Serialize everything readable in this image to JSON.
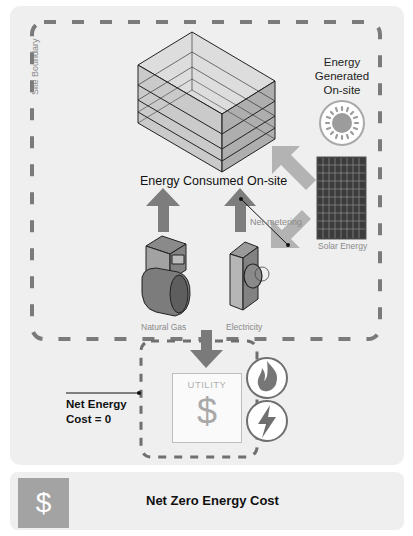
{
  "diagram": {
    "title": "Net Zero Energy Cost",
    "site_boundary_label": "Site Boundary",
    "energy_generated_label": [
      "Energy",
      "Generated",
      "On-site"
    ],
    "energy_consumed_label": "Energy Consumed On-site",
    "net_metering_label": "Net-metering",
    "solar_label": "Solar Energy",
    "natural_gas_label": "Natural Gas",
    "electricity_label": "Electricity",
    "utility": {
      "label": "UTILITY",
      "symbol": "$"
    },
    "net_cost_label": [
      "Net Energy",
      "Cost = 0"
    ],
    "icons": [
      "building-icon",
      "sun-icon",
      "solar-panel-icon",
      "gas-meter-icon",
      "electric-meter-icon",
      "flame-icon",
      "lightning-icon",
      "dollar-icon"
    ],
    "colors": {
      "panel_bg": "#efefef",
      "dash": "#7a7a7a",
      "arrow_dark": "#7d7d7d",
      "arrow_light": "#b3b3b3",
      "footer_icon_bg": "#a3a3a3"
    }
  },
  "footer": {
    "icon_symbol": "$",
    "title": "Net Zero Energy Cost"
  }
}
